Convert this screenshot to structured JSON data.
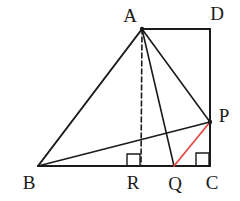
{
  "figure": {
    "background_color": "#ffffff",
    "stroke_color": "#1a1a1a",
    "accent_color": "#e04a42",
    "width": 240,
    "height": 201
  },
  "points": {
    "A": {
      "label": "A",
      "x": 142,
      "y": 29,
      "label_x": 130,
      "label_y": 22
    },
    "D": {
      "label": "D",
      "x": 210,
      "y": 29,
      "label_x": 217,
      "label_y": 20
    },
    "P": {
      "label": "P",
      "x": 210,
      "y": 122,
      "label_x": 224,
      "label_y": 122
    },
    "C": {
      "label": "C",
      "x": 210,
      "y": 166,
      "label_x": 212,
      "label_y": 189
    },
    "Q": {
      "label": "Q",
      "x": 174,
      "y": 166,
      "label_x": 175,
      "label_y": 190
    },
    "R": {
      "label": "R",
      "x": 141,
      "y": 166,
      "label_x": 133,
      "label_y": 189
    },
    "B": {
      "label": "B",
      "x": 38,
      "y": 166,
      "label_x": 29,
      "label_y": 189
    }
  },
  "segments": [
    {
      "name": "segment-A-D",
      "from": "A",
      "to": "D",
      "style": "solid",
      "color": "#1a1a1a",
      "width": 2.0
    },
    {
      "name": "segment-D-C",
      "from": "D",
      "to": "C",
      "style": "solid",
      "color": "#1a1a1a",
      "width": 2.0
    },
    {
      "name": "segment-B-C",
      "from": "B",
      "to": "C",
      "style": "solid",
      "color": "#1a1a1a",
      "width": 2.0
    },
    {
      "name": "segment-A-B",
      "from": "A",
      "to": "B",
      "style": "solid",
      "color": "#1a1a1a",
      "width": 2.0
    },
    {
      "name": "segment-A-P",
      "from": "A",
      "to": "P",
      "style": "solid",
      "color": "#1a1a1a",
      "width": 1.6
    },
    {
      "name": "segment-A-Q",
      "from": "A",
      "to": "Q",
      "style": "solid",
      "color": "#1a1a1a",
      "width": 1.6
    },
    {
      "name": "segment-B-P",
      "from": "B",
      "to": "P",
      "style": "solid",
      "color": "#1a1a1a",
      "width": 1.6
    },
    {
      "name": "segment-A-R-altitude",
      "from": "A",
      "to": "R",
      "style": "dashed",
      "color": "#1a1a1a",
      "width": 1.6
    },
    {
      "name": "segment-Q-P-highlight",
      "from": "Q",
      "to": "P",
      "style": "solid",
      "color": "#e04a42",
      "width": 1.8
    }
  ],
  "right_angles": [
    {
      "name": "right-angle-mark-at-R",
      "x": 127,
      "y": 154,
      "size": 13,
      "vertex": "R"
    },
    {
      "name": "right-angle-mark-at-C",
      "x": 196,
      "y": 153,
      "size": 13,
      "vertex": "C"
    }
  ]
}
